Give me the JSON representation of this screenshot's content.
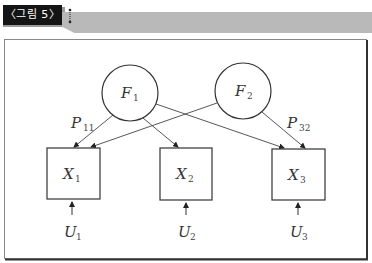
{
  "figure": {
    "label": "〈그림 5〉",
    "colors": {
      "label_bg": "#141414",
      "header_bar": "#b9b9b9",
      "frame": "#555555",
      "frame_shadow": "#333333",
      "stroke": "#333333"
    }
  },
  "diagram": {
    "factors": [
      {
        "id": "F1",
        "letter": "F",
        "sub": "1",
        "cx": 130,
        "cy": 93,
        "r": 28
      },
      {
        "id": "F2",
        "letter": "F",
        "sub": "2",
        "cx": 243,
        "cy": 91,
        "r": 28
      }
    ],
    "observed": [
      {
        "id": "X1",
        "letter": "X",
        "sub": "1",
        "x": 47,
        "y": 148,
        "w": 53,
        "h": 51
      },
      {
        "id": "X2",
        "letter": "X",
        "sub": "2",
        "x": 160,
        "y": 148,
        "w": 52,
        "h": 52
      },
      {
        "id": "X3",
        "letter": "X",
        "sub": "3",
        "x": 272,
        "y": 149,
        "w": 53,
        "h": 51
      }
    ],
    "errors": [
      {
        "id": "U1",
        "letter": "U",
        "sub": "1",
        "x": 73
      },
      {
        "id": "U2",
        "letter": "U",
        "sub": "2",
        "x": 186
      },
      {
        "id": "U3",
        "letter": "U",
        "sub": "3",
        "x": 299
      }
    ],
    "paths": [
      {
        "from": "F1",
        "to": "X1"
      },
      {
        "from": "F1",
        "to": "X2"
      },
      {
        "from": "F1",
        "to": "X3"
      },
      {
        "from": "F2",
        "to": "X1"
      },
      {
        "from": "F2",
        "to": "X3"
      }
    ],
    "path_labels": [
      {
        "letter": "P",
        "sub": "11"
      },
      {
        "letter": "P",
        "sub": "32"
      }
    ]
  }
}
